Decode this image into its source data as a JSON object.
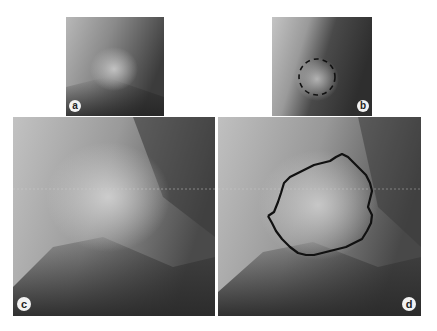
{
  "figure": {
    "panels": [
      {
        "id": "a",
        "label": "a",
        "description": "Small crop of grayscale radiograph showing bright rounded mass"
      },
      {
        "id": "b",
        "label": "b",
        "description": "Same crop with initial dotted circular contour around mass"
      },
      {
        "id": "c",
        "label": "c",
        "description": "Enlarged view of the mass region"
      },
      {
        "id": "d",
        "label": "d",
        "description": "Enlarged view with final irregular segmentation contour"
      }
    ],
    "colors": {
      "background": "#ffffff",
      "contour": "#111111",
      "label_bg": "#f2f2f2"
    }
  }
}
